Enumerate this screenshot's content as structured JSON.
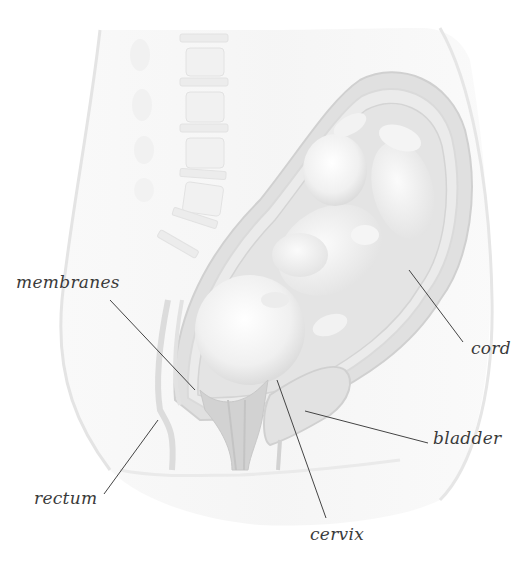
{
  "diagram": {
    "labels": [
      {
        "id": "membranes",
        "text": "membranes",
        "x": 16,
        "y": 277,
        "line": [
          110,
          300,
          195,
          390
        ]
      },
      {
        "id": "cord",
        "text": "cord",
        "x": 471,
        "y": 342,
        "line": [
          409,
          270,
          463,
          342
        ]
      },
      {
        "id": "bladder",
        "text": "bladder",
        "x": 433,
        "y": 433,
        "line": [
          305,
          411,
          428,
          443
        ]
      },
      {
        "id": "rectum",
        "text": "rectum",
        "x": 34,
        "y": 494,
        "line": [
          158,
          420,
          104,
          494
        ]
      },
      {
        "id": "cervix",
        "text": "cervix",
        "x": 310,
        "y": 528,
        "line": [
          277,
          380,
          326,
          518
        ]
      }
    ],
    "colors": {
      "background": "#ffffff",
      "body_fill": "#f1f1f1",
      "uterus_wall": "#d8d8d8",
      "fetus": "#ececec",
      "leader_line": "#444444",
      "label_text": "#3a3a3a"
    }
  }
}
